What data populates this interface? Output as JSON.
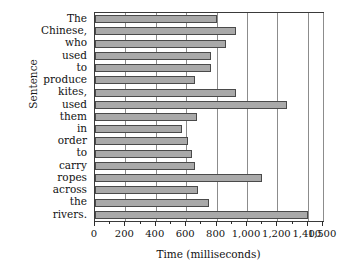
{
  "chart_data": {
    "type": "bar",
    "orientation": "horizontal",
    "title": "",
    "xlabel": "Time (milliseconds)",
    "ylabel": "Sentence",
    "xlim": [
      0,
      1500
    ],
    "grid": true,
    "legend": null,
    "bar_color": "#a9a9a9",
    "bar_edge_color": "#4a4a4a",
    "xticks": [
      0,
      200,
      400,
      600,
      800,
      1000,
      1200,
      1400,
      1500
    ],
    "xticklabels": [
      "0",
      "200",
      "400",
      "600",
      "800",
      "1,000",
      "1,200",
      "1,400",
      "1,500"
    ],
    "minor_tick_step": 100,
    "categories": [
      "The",
      "Chinese,",
      "who",
      "used",
      "to",
      "produce",
      "kites,",
      "used",
      "them",
      "in",
      "order",
      "to",
      "carry",
      "ropes",
      "across",
      "the",
      "rivers."
    ],
    "values": [
      800,
      930,
      860,
      760,
      760,
      660,
      930,
      1260,
      670,
      570,
      610,
      640,
      660,
      1100,
      680,
      750,
      1400
    ]
  }
}
